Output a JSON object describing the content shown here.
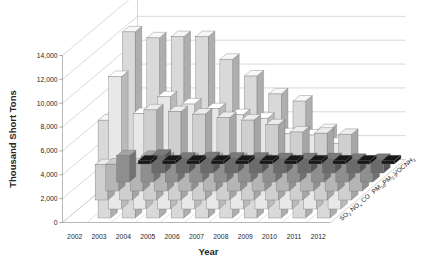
{
  "chart_data": {
    "type": "bar",
    "subtype": "3d-column",
    "title": "",
    "xlabel": "Year",
    "ylabel": "Thousand Short Tons",
    "zlabel": "",
    "ylim": [
      0,
      14000
    ],
    "ytick_step": 2000,
    "yticks": [
      "0",
      "2,000",
      "4,000",
      "6,000",
      "8,000",
      "10,000",
      "12,000",
      "14,000"
    ],
    "grid": true,
    "legend": "z-axis-depth",
    "categories": [
      "2002",
      "2003",
      "2004",
      "2005",
      "2006",
      "2007",
      "2008",
      "2009",
      "2010",
      "2011",
      "2012"
    ],
    "series": [
      {
        "name": "SO2",
        "label_base": "SO",
        "label_sub": "2",
        "depth_index": 0,
        "color": "#d9d9d9",
        "values": [
          null,
          8200,
          15600,
          15100,
          15200,
          15200,
          13300,
          11900,
          10400,
          9800,
          7400
        ]
      },
      {
        "name": "NOx",
        "label_base": "NO",
        "label_sub": "x",
        "depth_index": 1,
        "color": "#e8e8e8",
        "values": [
          null,
          11100,
          8000,
          9400,
          8800,
          8400,
          7900,
          7600,
          6300,
          6200,
          5500
        ]
      },
      {
        "name": "CO",
        "label_base": "CO",
        "label_sub": "",
        "depth_index": 2,
        "color": "#cfcfcf",
        "values": [
          2950,
          2800,
          7550,
          7400,
          7200,
          6900,
          6700,
          6300,
          5700,
          5600,
          5500
        ]
      },
      {
        "name": "PM10",
        "label_base": "PM",
        "label_sub": "10",
        "depth_index": 3,
        "color": "#b5b5b5",
        "values": [
          2250,
          2280,
          2750,
          2700,
          2700,
          2700,
          2600,
          2550,
          2500,
          2450,
          2400
        ]
      },
      {
        "name": "PM2.5",
        "label_base": "PM",
        "label_sub": "2.5",
        "depth_index": 4,
        "color": "#8f8f8f",
        "values": [
          2200,
          2150,
          1700,
          1750,
          1700,
          1650,
          1600,
          1600,
          1550,
          1550,
          1500
        ]
      },
      {
        "name": "VOC",
        "label_base": "VOC",
        "label_sub": "",
        "depth_index": 5,
        "color": "#6b6b6b",
        "values": [
          null,
          1500,
          1250,
          1300,
          1250,
          1250,
          1200,
          1200,
          1200,
          1150,
          1150
        ]
      },
      {
        "name": "NH3",
        "label_base": "NH",
        "label_sub": "3",
        "depth_index": 6,
        "color": "#161616",
        "values": [
          260,
          260,
          260,
          260,
          260,
          260,
          260,
          260,
          260,
          260,
          260
        ]
      }
    ]
  }
}
